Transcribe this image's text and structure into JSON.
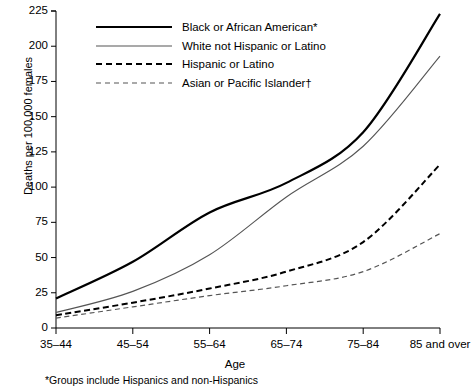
{
  "chart_data": {
    "type": "line",
    "title": "",
    "xlabel": "Age",
    "ylabel": "Deaths per 100,000 females",
    "categories": [
      "35–44",
      "45–54",
      "55–64",
      "65–74",
      "75–84",
      "85 and over"
    ],
    "ylim": [
      0,
      225
    ],
    "yticks": [
      0,
      25,
      50,
      75,
      100,
      125,
      150,
      175,
      200,
      225
    ],
    "ytick_labels": [
      "0",
      "25",
      "50",
      "75",
      "100",
      "125",
      "150",
      "175",
      "200",
      "225"
    ],
    "grid": false,
    "legend_position": "top-left-inside",
    "series": [
      {
        "name": "Black or African American*",
        "style": "solid",
        "width": 2.2,
        "color": "#000000",
        "values": [
          21,
          47,
          82,
          103,
          139,
          223
        ]
      },
      {
        "name": "White not Hispanic or Latino",
        "style": "solid",
        "width": 1.1,
        "color": "#555555",
        "values": [
          11,
          26,
          52,
          93,
          129,
          193
        ]
      },
      {
        "name": "Hispanic or Latino",
        "style": "dashed",
        "width": 2.0,
        "color": "#000000",
        "values": [
          9,
          18,
          28,
          40,
          61,
          116
        ]
      },
      {
        "name": "Asian or Pacific Islander†",
        "style": "dashed",
        "width": 1.2,
        "color": "#555555",
        "values": [
          7,
          15,
          23,
          30,
          40,
          67
        ]
      }
    ],
    "annotations": [
      "*Groups include Hispanics and non-Hispanics"
    ]
  },
  "footnote": "*Groups include Hispanics and non-Hispanics"
}
